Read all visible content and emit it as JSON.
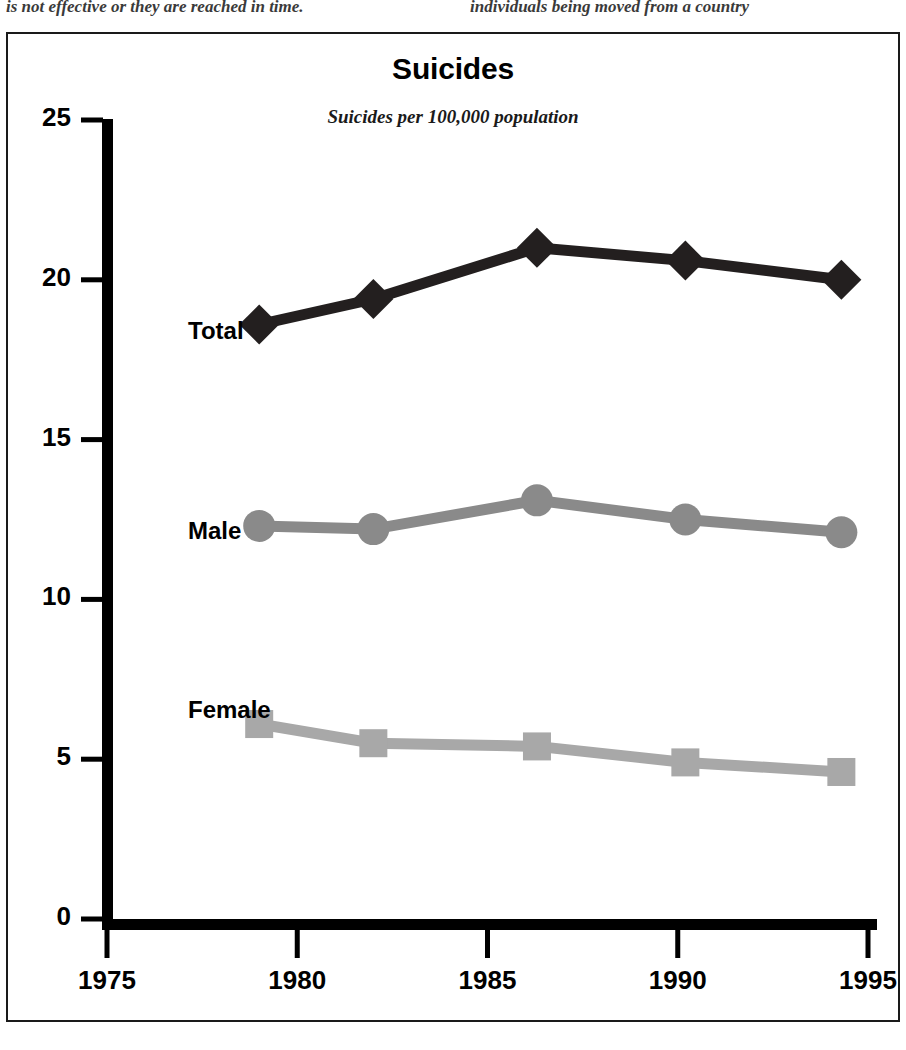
{
  "page": {
    "bleed_text_left": "is not effective or they are reached in time.",
    "bleed_text_right": "individuals being moved from a country"
  },
  "chart_data": {
    "type": "line",
    "title": "Suicides",
    "subtitle": "Suicides per 100,000 population",
    "xlabel": "",
    "ylabel": "",
    "xlim": [
      1975,
      1995
    ],
    "ylim": [
      0,
      25
    ],
    "ytick_labels": [
      "25",
      "20",
      "15",
      "10",
      "5",
      "0"
    ],
    "yticks": [
      25,
      20,
      15,
      10,
      5,
      0
    ],
    "xtick_labels": [
      "1975",
      "1980",
      "1985",
      "1990",
      "1995"
    ],
    "xticks": [
      1975,
      1980,
      1985,
      1990,
      1995
    ],
    "grid": false,
    "legend_position": "inline-left-of-series",
    "x": [
      1979,
      1982,
      1986.3,
      1990.2,
      1994.3
    ],
    "series": [
      {
        "name": "Total",
        "values": [
          18.6,
          19.4,
          21.0,
          20.6,
          20.0
        ],
        "color": "#231f1f",
        "marker": "diamond",
        "label_x": 180,
        "label_y": 283
      },
      {
        "name": "Male",
        "values": [
          12.3,
          12.2,
          13.1,
          12.5,
          12.1
        ],
        "color": "#8a8a8a",
        "marker": "circle",
        "label_x": 180,
        "label_y": 483
      },
      {
        "name": "Female",
        "values": [
          6.1,
          5.5,
          5.4,
          4.9,
          4.6
        ],
        "color": "#a8a8a8",
        "marker": "square",
        "label_x": 180,
        "label_y": 662
      }
    ]
  },
  "style": {
    "axis_color": "#000000",
    "frame_color": "#1a1a1a",
    "background": "#ffffff"
  }
}
